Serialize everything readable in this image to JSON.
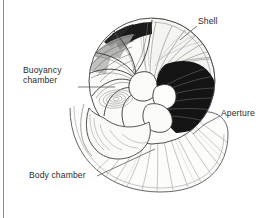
{
  "figure": {
    "kind": "scientific-illustration",
    "background_color": "#ffffff",
    "ink_color": "#2b2b2b",
    "border": {
      "side": "left",
      "color": "#8a8a8a"
    }
  },
  "labels": {
    "shell": "Shell",
    "buoyancy_line1": "Buoyancy",
    "buoyancy_line2": "chamber",
    "aperture": "Aperture",
    "body_chamber": "Body chamber"
  },
  "callouts": [
    {
      "name": "shell",
      "text": "Shell",
      "anchor": "upper-right-shell-wall"
    },
    {
      "name": "buoyancy",
      "text": "Buoyancy chamber",
      "anchor": "left-inner-chambers"
    },
    {
      "name": "aperture",
      "text": "Aperture",
      "anchor": "right-opening-edge"
    },
    {
      "name": "body-chamber",
      "text": "Body chamber",
      "anchor": "lower-large-chamber"
    }
  ],
  "shading": {
    "dark_fill": "#111111",
    "mid_fill": "#9a9a9a",
    "light_fill": "#f2f2ef",
    "hatch_stroke": "#4a4a4a",
    "outline_stroke": "#3a3a3a"
  }
}
